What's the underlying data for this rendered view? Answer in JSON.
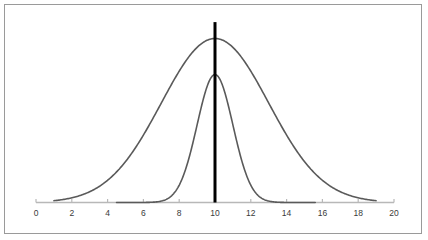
{
  "figure": {
    "background_color": "#ffffff",
    "border_color": "#9a9a9a"
  },
  "chart_data": {
    "type": "line",
    "title": "",
    "subtitle": "",
    "xlabel": "",
    "ylabel": "",
    "xlim": [
      0,
      20
    ],
    "ylim": [
      0,
      1
    ],
    "grid": false,
    "legend": "none",
    "axis": {
      "color": "#b8b8b8",
      "tick_color": "#b8b8b8",
      "label_color": "#3a3a3a",
      "tick_labels": [
        "0",
        "2",
        "4",
        "6",
        "8",
        "10",
        "12",
        "14",
        "16",
        "18",
        "20"
      ],
      "tick_values": [
        0,
        2,
        4,
        6,
        8,
        10,
        12,
        14,
        16,
        18,
        20
      ]
    },
    "series": [
      {
        "name": "wide-normal-curve",
        "type": "normal_pdf",
        "mean": 10,
        "sigma": 3,
        "peak_value": 1.0,
        "color": "#5a5a5a",
        "line_width": 1.6,
        "x_start": 1.0,
        "x_end": 19.0
      },
      {
        "name": "narrow-normal-curve",
        "type": "normal_pdf",
        "mean": 10,
        "sigma": 1,
        "peak_value": 0.78,
        "color": "#5a5a5a",
        "line_width": 1.6,
        "x_start": 4.5,
        "x_end": 15.6
      }
    ],
    "annotations": [
      {
        "name": "mean-vertical-line",
        "type": "vline",
        "x": 10,
        "color": "#000000",
        "line_width": 3,
        "y_top_value": 1.1,
        "y_bottom_value": 0
      }
    ]
  }
}
